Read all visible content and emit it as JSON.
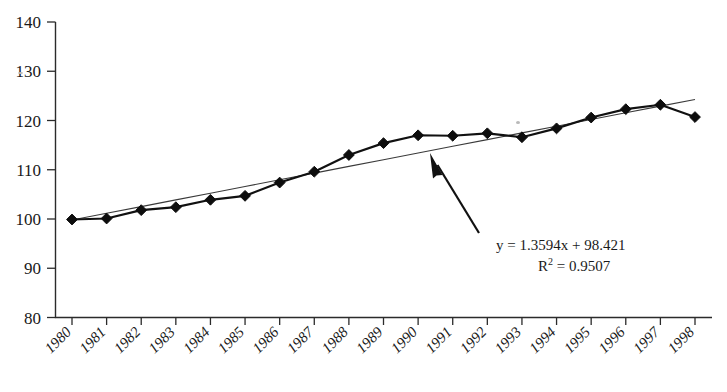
{
  "chart_data": {
    "type": "line",
    "title": "",
    "xlabel": "",
    "ylabel": "",
    "categories": [
      "1980",
      "1981",
      "1982",
      "1983",
      "1984",
      "1985",
      "1986",
      "1987",
      "1988",
      "1989",
      "1990",
      "1991",
      "1992",
      "1993",
      "1994",
      "1995",
      "1996",
      "1997",
      "1998"
    ],
    "series": [
      {
        "name": "index",
        "marker": "diamond",
        "values": [
          99.9,
          100.1,
          101.8,
          102.4,
          103.9,
          104.7,
          107.4,
          109.6,
          113.0,
          115.4,
          117.0,
          116.9,
          117.4,
          116.6,
          118.4,
          120.6,
          122.3,
          123.2,
          120.7
        ]
      },
      {
        "name": "linear-trend",
        "marker": "none",
        "values": [
          99.8,
          101.16,
          102.52,
          103.88,
          105.24,
          106.6,
          107.96,
          109.32,
          110.68,
          112.04,
          113.4,
          114.76,
          116.12,
          117.48,
          118.84,
          120.2,
          121.56,
          122.92,
          124.28
        ]
      }
    ],
    "ylim": [
      80,
      140
    ],
    "yticks": [
      80,
      90,
      100,
      110,
      120,
      130,
      140
    ],
    "ytick_labels": [
      "80",
      "90",
      "100",
      "110",
      "120",
      "130",
      "140"
    ],
    "xtick_rotation": -45,
    "grid": false,
    "legend": false,
    "annotations": [
      {
        "name": "trendline-equation",
        "line1": "y = 1.3594x + 98.421",
        "r2_prefix": "R",
        "r2_sup": "2",
        "r2_value": " = 0.9507"
      },
      {
        "name": "pointer-arrow",
        "points_to": "linear-trend"
      }
    ],
    "colors": {
      "series_line": "#111111",
      "trend_line": "#3a3a3a",
      "marker": "#0d0d0d",
      "axis": "#2b2b2b",
      "background": "#ffffff"
    }
  }
}
